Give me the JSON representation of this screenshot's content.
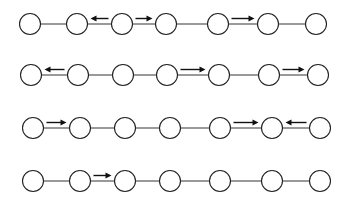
{
  "diagram": {
    "title": "",
    "width": 345,
    "height": 200,
    "colors": {
      "background": "#ffffff",
      "node_stroke": "#222222",
      "edge": "#555555",
      "arrow": "#111111"
    },
    "node_radius": 10.5,
    "rows": [
      {
        "y": 24,
        "nodes_x": [
          30,
          77,
          122,
          166,
          218,
          268,
          316
        ],
        "arrows": [
          {
            "between": [
              2,
              3
            ],
            "direction": "left"
          },
          {
            "between": [
              3,
              4
            ],
            "direction": "right"
          },
          {
            "between": [
              5,
              6
            ],
            "direction": "right"
          }
        ]
      },
      {
        "y": 75,
        "nodes_x": [
          31,
          78,
          123,
          167,
          219,
          269,
          318
        ],
        "arrows": [
          {
            "between": [
              1,
              2
            ],
            "direction": "left"
          },
          {
            "between": [
              4,
              5
            ],
            "direction": "right"
          },
          {
            "between": [
              6,
              7
            ],
            "direction": "right"
          }
        ]
      },
      {
        "y": 128,
        "nodes_x": [
          33,
          80,
          125,
          170,
          220,
          272,
          320
        ],
        "arrows": [
          {
            "between": [
              1,
              2
            ],
            "direction": "right"
          },
          {
            "between": [
              5,
              6
            ],
            "direction": "right"
          },
          {
            "between": [
              6,
              7
            ],
            "direction": "left"
          }
        ]
      },
      {
        "y": 181,
        "nodes_x": [
          33,
          80,
          125,
          170,
          220,
          272,
          320
        ],
        "arrows": [
          {
            "between": [
              2,
              3
            ],
            "direction": "right"
          }
        ]
      }
    ]
  }
}
